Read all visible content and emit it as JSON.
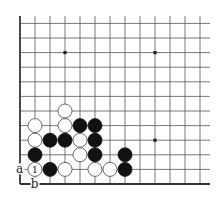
{
  "diagram": {
    "type": "go-board-corner",
    "corner": "bottom-left",
    "columns_visible": 13,
    "rows_visible": 12,
    "colors": {
      "black": "#111111",
      "white": "#ffffff",
      "line": "#555555"
    },
    "star_points": [
      {
        "col": 3,
        "row": 9
      },
      {
        "col": 9,
        "row": 9
      },
      {
        "col": 9,
        "row": 3
      }
    ],
    "stones": [
      {
        "color": "white",
        "col": 3,
        "row": 5
      },
      {
        "color": "white",
        "col": 1,
        "row": 4
      },
      {
        "color": "white",
        "col": 3,
        "row": 4
      },
      {
        "color": "black",
        "col": 4,
        "row": 4
      },
      {
        "color": "black",
        "col": 5,
        "row": 4
      },
      {
        "color": "white",
        "col": 1,
        "row": 3
      },
      {
        "color": "black",
        "col": 2,
        "row": 3
      },
      {
        "color": "black",
        "col": 3,
        "row": 3
      },
      {
        "color": "white",
        "col": 4,
        "row": 3
      },
      {
        "color": "black",
        "col": 5,
        "row": 3
      },
      {
        "color": "black",
        "col": 1,
        "row": 2
      },
      {
        "color": "white",
        "col": 4,
        "row": 2
      },
      {
        "color": "black",
        "col": 5,
        "row": 2
      },
      {
        "color": "black",
        "col": 7,
        "row": 2
      },
      {
        "color": "white",
        "col": 1,
        "row": 1,
        "label": "1"
      },
      {
        "color": "black",
        "col": 2,
        "row": 1
      },
      {
        "color": "white",
        "col": 3,
        "row": 1
      },
      {
        "color": "white",
        "col": 5,
        "row": 1
      },
      {
        "color": "white",
        "col": 6,
        "row": 1
      },
      {
        "color": "black",
        "col": 7,
        "row": 1
      }
    ],
    "point_labels": [
      {
        "text": "a",
        "col": 0,
        "row": 1
      },
      {
        "text": "b",
        "col": 1,
        "row": 0
      }
    ]
  }
}
